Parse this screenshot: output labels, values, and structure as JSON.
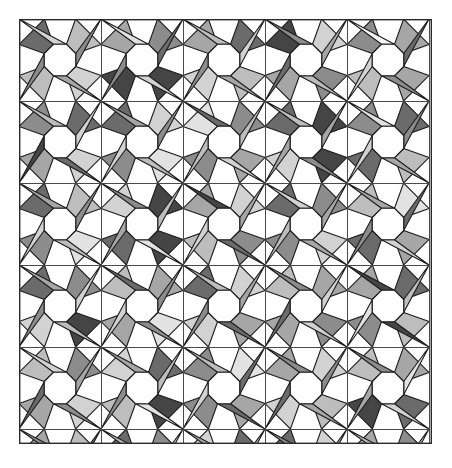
{
  "figure": {
    "type": "geometric-tiling",
    "viewport": {
      "x": 19,
      "y": 19,
      "width": 413,
      "height": 425
    },
    "background_color": "#ffffff",
    "border_color": "#2b2b2b",
    "border_width": 1.4
  },
  "grid": {
    "cell_size": 82,
    "origin_x": 19,
    "origin_y": 19,
    "columns": 5,
    "rows": 6,
    "line_color": "#4a4a4a",
    "line_width": 1.0,
    "visible": true
  },
  "motif": {
    "description": "white regular octagon centred in each grid cell, ringed by eight grayscale wedges: four corner kites and four edge trapezoids",
    "octagon_radius": 17,
    "octagon_fill": "#ffffff",
    "wedge_count_per_cell": 8,
    "stroke_color": "#1c1c1c",
    "stroke_width": 1.1
  },
  "palette": {
    "labels": [
      "white",
      "near-white",
      "very-light-gray",
      "light-gray",
      "mid-light-gray",
      "mid-gray",
      "gray",
      "dark-gray",
      "very-dark-gray"
    ],
    "values": [
      "#ffffff",
      "#f4f4f4",
      "#e2e2e2",
      "#d2d2d2",
      "#bdbdbd",
      "#a6a6a6",
      "#8c8c8c",
      "#6b6b6b",
      "#454545"
    ]
  },
  "chart_data": {
    "type": "heatmap",
    "xlabel": "",
    "ylabel": "",
    "grid": true,
    "legend": "none",
    "categories": [
      "w0",
      "w1",
      "w2",
      "w3",
      "w4",
      "w5",
      "w6",
      "w7"
    ],
    "note": "Each cell lists the gray palette index (0=white .. 8=very dark) of its eight wedges, ordered clockwise starting at the top-left corner kite.",
    "cells": [
      {
        "row": 0,
        "col": 0,
        "wedges": [
          3,
          5,
          4,
          6,
          7,
          3,
          4,
          6
        ]
      },
      {
        "row": 0,
        "col": 1,
        "wedges": [
          8,
          3,
          8,
          6,
          5,
          2,
          6,
          7
        ]
      },
      {
        "row": 0,
        "col": 2,
        "wedges": [
          4,
          5,
          3,
          6,
          5,
          4,
          7,
          3
        ]
      },
      {
        "row": 0,
        "col": 3,
        "wedges": [
          6,
          4,
          5,
          7,
          8,
          6,
          3,
          5
        ]
      },
      {
        "row": 0,
        "col": 4,
        "wedges": [
          5,
          6,
          4,
          3,
          6,
          1,
          5,
          7
        ]
      },
      {
        "row": 1,
        "col": 0,
        "wedges": [
          3,
          7,
          5,
          8,
          6,
          4,
          7,
          3
        ]
      },
      {
        "row": 1,
        "col": 1,
        "wedges": [
          2,
          4,
          6,
          3,
          7,
          5,
          3,
          6
        ]
      },
      {
        "row": 1,
        "col": 2,
        "wedges": [
          5,
          3,
          6,
          4,
          2,
          7,
          6,
          4
        ]
      },
      {
        "row": 1,
        "col": 3,
        "wedges": [
          8,
          6,
          3,
          5,
          7,
          4,
          8,
          5
        ]
      },
      {
        "row": 1,
        "col": 4,
        "wedges": [
          4,
          5,
          7,
          3,
          6,
          2,
          7,
          6
        ]
      },
      {
        "row": 2,
        "col": 0,
        "wedges": [
          2,
          4,
          6,
          3,
          7,
          5,
          4,
          6
        ]
      },
      {
        "row": 2,
        "col": 1,
        "wedges": [
          8,
          2,
          7,
          5,
          3,
          6,
          8,
          4
        ]
      },
      {
        "row": 2,
        "col": 2,
        "wedges": [
          6,
          7,
          4,
          3,
          5,
          8,
          3,
          5
        ]
      },
      {
        "row": 2,
        "col": 3,
        "wedges": [
          3,
          5,
          6,
          4,
          7,
          3,
          6,
          5
        ]
      },
      {
        "row": 2,
        "col": 4,
        "wedges": [
          5,
          3,
          7,
          6,
          4,
          5,
          2,
          7
        ]
      },
      {
        "row": 3,
        "col": 0,
        "wedges": [
          8,
          4,
          3,
          6,
          7,
          5,
          6,
          3
        ]
      },
      {
        "row": 3,
        "col": 1,
        "wedges": [
          2,
          6,
          5,
          3,
          4,
          7,
          5,
          6
        ]
      },
      {
        "row": 3,
        "col": 2,
        "wedges": [
          5,
          7,
          3,
          6,
          7,
          4,
          3,
          5
        ]
      },
      {
        "row": 3,
        "col": 3,
        "wedges": [
          6,
          3,
          5,
          7,
          4,
          6,
          5,
          3
        ]
      },
      {
        "row": 3,
        "col": 4,
        "wedges": [
          4,
          8,
          6,
          2,
          5,
          8,
          7,
          4
        ]
      },
      {
        "row": 4,
        "col": 0,
        "wedges": [
          3,
          6,
          5,
          7,
          4,
          3,
          6,
          5
        ]
      },
      {
        "row": 4,
        "col": 1,
        "wedges": [
          8,
          2,
          4,
          6,
          3,
          5,
          7,
          4
        ]
      },
      {
        "row": 4,
        "col": 2,
        "wedges": [
          5,
          7,
          6,
          3,
          6,
          4,
          2,
          7
        ]
      },
      {
        "row": 4,
        "col": 3,
        "wedges": [
          4,
          5,
          3,
          7,
          5,
          6,
          3,
          6
        ]
      },
      {
        "row": 4,
        "col": 4,
        "wedges": [
          7,
          3,
          8,
          5,
          4,
          6,
          5,
          2
        ]
      },
      {
        "row": 5,
        "col": 0,
        "wedges": [
          6,
          4,
          7,
          3,
          5,
          6,
          4,
          7
        ]
      },
      {
        "row": 5,
        "col": 1,
        "wedges": [
          3,
          6,
          2,
          5,
          7,
          4,
          6,
          3
        ]
      },
      {
        "row": 5,
        "col": 2,
        "wedges": [
          5,
          7,
          4,
          6,
          3,
          5,
          7,
          4
        ]
      },
      {
        "row": 5,
        "col": 3,
        "wedges": [
          6,
          3,
          5,
          4,
          7,
          6,
          3,
          5
        ]
      },
      {
        "row": 5,
        "col": 4,
        "wedges": [
          4,
          6,
          3,
          7,
          5,
          4,
          6,
          3
        ]
      }
    ]
  }
}
